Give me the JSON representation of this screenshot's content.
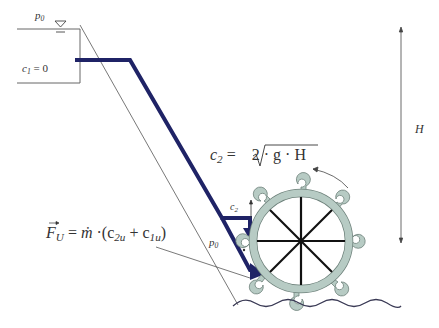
{
  "diagram": {
    "labels": {
      "p0_top": "p",
      "p0_top_sub": "0",
      "c1_var": "c",
      "c1_sub": "1",
      "c1_eq": " = 0",
      "c2_formula_var": "c",
      "c2_formula_sub": "2",
      "c2_formula_eq": " = ",
      "c2_formula_rad": "2 · g · H",
      "c2_small": "c",
      "c2_small_sub": "2",
      "p0_bottom": "p",
      "p0_bottom_sub": "0",
      "H": "H",
      "force_F": "F",
      "force_F_sub": "U",
      "force_eq": " = ",
      "force_mdot": "ṁ",
      "force_rest": " ·(c",
      "force_c2u_sub": "2u",
      "force_plus": " + c",
      "force_c1u_sub": "1u",
      "force_close": ")"
    },
    "colors": {
      "pipe": "#1f2366",
      "wheel_fill": "#b7cbc4",
      "wheel_stroke": "#6d807a",
      "spokes": "#111111",
      "thin_lines": "#555555",
      "wave": "#3a3a55",
      "text": "#333333"
    },
    "wheel": {
      "cx": 301,
      "cy": 241,
      "r": 48,
      "buckets": 8
    },
    "height_arrow": {
      "x": 401,
      "y_top": 28,
      "y_bottom": 242
    }
  }
}
